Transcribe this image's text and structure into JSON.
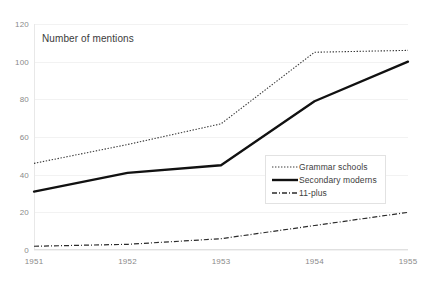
{
  "chart_data": {
    "type": "line",
    "title": "Number of mentions",
    "xlabel": "",
    "ylabel": "",
    "x": [
      "1951",
      "1952",
      "1953",
      "1954",
      "1955"
    ],
    "categories": [
      "1951",
      "1952",
      "1953",
      "1954",
      "1955"
    ],
    "ylim": [
      0,
      120
    ],
    "xlim": [
      "1951",
      "1955"
    ],
    "yticks": [
      "0",
      "20",
      "40",
      "60",
      "80",
      "100",
      "120"
    ],
    "ytick_values": [
      0,
      20,
      40,
      60,
      80,
      100,
      120
    ],
    "grid": true,
    "grid_axis": "y",
    "legend_position": "center-right",
    "series": [
      {
        "name": "Grammar schools",
        "style": "dotted",
        "color": "#3a3a3a",
        "values": [
          46,
          56,
          67,
          105,
          106
        ]
      },
      {
        "name": "Secondary moderns",
        "style": "solid",
        "color": "#1a1a1a",
        "values": [
          31,
          41,
          45,
          79,
          100
        ]
      },
      {
        "name": "11-plus",
        "style": "dash-dot",
        "color": "#2b2b2b",
        "values": [
          2,
          3,
          6,
          13,
          20
        ]
      }
    ]
  },
  "legend": {
    "items": [
      {
        "label": "Grammar schools"
      },
      {
        "label": "Secondary moderns"
      },
      {
        "label": "11-plus"
      }
    ]
  },
  "colors": {
    "background": "#ffffff",
    "gridline": "#f2f2f2",
    "axis": "#e0e0e0",
    "tick_text": "#8a8a8a",
    "title_text": "#3b3b3b",
    "legend_border": "#e2e2e2"
  }
}
